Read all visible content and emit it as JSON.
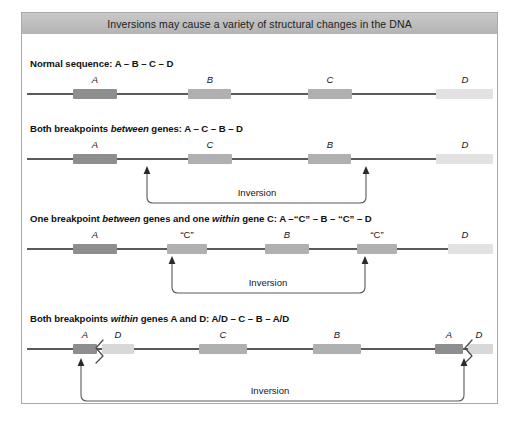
{
  "figure": {
    "title": "Inversions may cause a variety of structural changes in the DNA",
    "inversion_label": "Inversion",
    "colors": {
      "title_bar": "#bfbfbf",
      "frame_border": "#a9a9a9",
      "axis_line": "#5a5a5a",
      "gene_dark": "#8e8e8e",
      "gene_mid": "#b0b0b0",
      "gene_light": "#d8d8d8",
      "gene_xlight": "#e2e2e2",
      "bracket": "#5a5a5a"
    }
  },
  "panels": [
    {
      "id": "normal-sequence",
      "heading_pre": "Normal sequence: A – B – C – D",
      "heading_italic": "",
      "heading_post": "",
      "genes": [
        {
          "label": "A",
          "quoted": false,
          "shade": "dark",
          "left": 46,
          "width": 44
        },
        {
          "label": "B",
          "quoted": false,
          "shade": "mid",
          "left": 161,
          "width": 43
        },
        {
          "label": "C",
          "quoted": false,
          "shade": "mid",
          "left": 281,
          "width": 44
        },
        {
          "label": "D",
          "quoted": false,
          "shade": "xlight",
          "left": 409,
          "width": 57
        }
      ],
      "inversion": null
    },
    {
      "id": "both-breakpoints-between-genes",
      "heading_pre": "Both breakpoints ",
      "heading_italic": "between",
      "heading_post": " genes: A – C – B – D",
      "genes": [
        {
          "label": "A",
          "quoted": false,
          "shade": "dark",
          "left": 46,
          "width": 44
        },
        {
          "label": "C",
          "quoted": false,
          "shade": "mid",
          "left": 161,
          "width": 44
        },
        {
          "label": "B",
          "quoted": false,
          "shade": "mid",
          "left": 281,
          "width": 43
        },
        {
          "label": "D",
          "quoted": false,
          "shade": "xlight",
          "left": 409,
          "width": 57
        }
      ],
      "inversion": {
        "x1": 120,
        "x2": 339,
        "label_x": 230
      }
    },
    {
      "id": "one-breakpoint-between-one-within-gene-c",
      "heading_pre": "One breakpoint ",
      "heading_italic": "between",
      "heading_post": " genes and one ",
      "heading_italic2": "within",
      "heading_post2": " gene C: A –“C” – B – “C” – D",
      "genes": [
        {
          "label": "A",
          "quoted": false,
          "shade": "dark",
          "left": 46,
          "width": 44
        },
        {
          "label": "“C”",
          "quoted": true,
          "shade": "mid",
          "left": 140,
          "width": 40
        },
        {
          "label": "B",
          "quoted": false,
          "shade": "mid",
          "left": 238,
          "width": 44
        },
        {
          "label": "“C”",
          "quoted": true,
          "shade": "mid",
          "left": 330,
          "width": 40
        },
        {
          "label": "D",
          "quoted": false,
          "shade": "xlight",
          "left": 421,
          "width": 45
        }
      ],
      "inversion": {
        "x1": 145,
        "x2": 338,
        "label_x": 241
      }
    },
    {
      "id": "both-breakpoints-within-genes-a-and-d",
      "heading_pre": "Both breakpoints ",
      "heading_italic": "within",
      "heading_post": " genes A and D: A/D – C – B – A/D",
      "genes": [
        {
          "label": "A",
          "quoted": false,
          "shade": "dark",
          "left": 46,
          "width": 24,
          "fusion": "left-dark"
        },
        {
          "label": "D",
          "quoted": false,
          "shade": "light",
          "left": 75,
          "width": 32
        },
        {
          "label": "C",
          "quoted": false,
          "shade": "mid",
          "left": 172,
          "width": 48
        },
        {
          "label": "B",
          "quoted": false,
          "shade": "mid",
          "left": 286,
          "width": 48
        },
        {
          "label": "A",
          "quoted": false,
          "shade": "dark",
          "left": 408,
          "width": 28,
          "fusion": "right-dark"
        },
        {
          "label": "D",
          "quoted": false,
          "shade": "light",
          "left": 441,
          "width": 25
        }
      ],
      "inversion": {
        "x1": 54,
        "x2": 438,
        "label_x": 246
      }
    }
  ]
}
